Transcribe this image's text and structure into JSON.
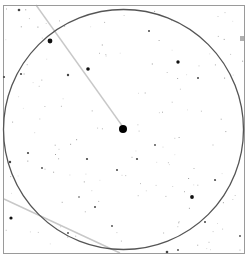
{
  "finder_chart": {
    "frame": {
      "x": 3.5,
      "y": 5.5,
      "width": 241,
      "height": 248,
      "stroke": "#9a9a9a"
    },
    "field_circle": {
      "cx": 123.5,
      "cy": 129.5,
      "r": 120,
      "stroke": "#555555"
    },
    "target_star": {
      "x": 123,
      "y": 129,
      "r": 4
    },
    "trail_lines": [
      {
        "x1": 36,
        "y1": 5,
        "x2": 123,
        "y2": 127,
        "stroke": "#c8c8c8"
      },
      {
        "x1": 4,
        "y1": 199,
        "x2": 120,
        "y2": 253,
        "stroke": "#c8c8c8"
      }
    ],
    "edge_marker": {
      "x": 240,
      "y": 36,
      "w": 4,
      "h": 5,
      "fill": "#b0b0b0"
    },
    "bright_stars": [
      {
        "x": 50,
        "y": 41,
        "r": 2.4
      },
      {
        "x": 88,
        "y": 69,
        "r": 1.8
      },
      {
        "x": 178,
        "y": 62,
        "r": 1.7
      },
      {
        "x": 19,
        "y": 10,
        "r": 1.3
      },
      {
        "x": 68,
        "y": 75,
        "r": 1.2
      },
      {
        "x": 21,
        "y": 74,
        "r": 1.1
      },
      {
        "x": 4,
        "y": 77,
        "r": 1.1
      },
      {
        "x": 198,
        "y": 78,
        "r": 1.0
      },
      {
        "x": 28,
        "y": 153,
        "r": 1.1
      },
      {
        "x": 10,
        "y": 162,
        "r": 1.2
      },
      {
        "x": 87,
        "y": 159,
        "r": 1.1
      },
      {
        "x": 117,
        "y": 170,
        "r": 1.0
      },
      {
        "x": 192,
        "y": 197,
        "r": 1.9
      },
      {
        "x": 11,
        "y": 218,
        "r": 1.6
      },
      {
        "x": 95,
        "y": 207,
        "r": 1.0
      },
      {
        "x": 137,
        "y": 159,
        "r": 1.1
      },
      {
        "x": 167,
        "y": 252,
        "r": 1.3
      },
      {
        "x": 205,
        "y": 222,
        "r": 1.0
      },
      {
        "x": 68,
        "y": 233,
        "r": 0.9
      },
      {
        "x": 112,
        "y": 226,
        "r": 0.9
      },
      {
        "x": 178,
        "y": 250,
        "r": 0.9
      },
      {
        "x": 215,
        "y": 180,
        "r": 1.0
      },
      {
        "x": 149,
        "y": 31,
        "r": 1.0
      },
      {
        "x": 240,
        "y": 236,
        "r": 0.9
      },
      {
        "x": 79,
        "y": 197,
        "r": 0.8
      },
      {
        "x": 42,
        "y": 168,
        "r": 0.9
      },
      {
        "x": 155,
        "y": 145,
        "r": 0.9
      }
    ],
    "faint_star_count": 140,
    "faint_star_seed": 7
  }
}
